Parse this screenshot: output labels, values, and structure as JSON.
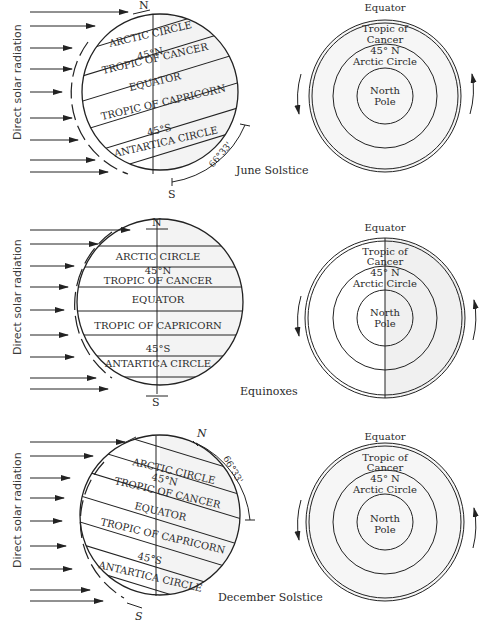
{
  "side_label": "Direct solar radiation",
  "zone_labels": {
    "arctic": "ARCTIC CIRCLE",
    "n45": "45°N",
    "cancer": "TROPIC OF CANCER",
    "equator": "EQUATOR",
    "capricorn": "TROPIC OF CAPRICORN",
    "s45": "45°S",
    "antarctic": "ANTARTICA CIRCLE"
  },
  "pole_labels": {
    "north": "N",
    "south": "S"
  },
  "tilt_angle": "66°33'",
  "polar_view_labels": {
    "equator": "Equator",
    "tropic_line1": "Tropic of",
    "tropic_line2": "Cancer",
    "n45": "45° N",
    "arctic": "Arctic Circle",
    "pole_line1": "North",
    "pole_line2": "Pole"
  },
  "panels": [
    {
      "id": "june",
      "caption": "June Solstice"
    },
    {
      "id": "equinox",
      "caption": "Equinoxes"
    },
    {
      "id": "december",
      "caption": "December Solstice"
    }
  ],
  "colors": {
    "ink": "#222222",
    "background": "#ffffff",
    "shade": "#eeeeee"
  }
}
